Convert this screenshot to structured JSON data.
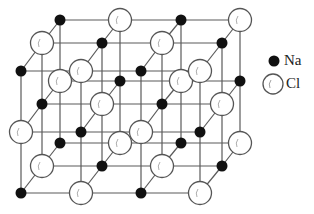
{
  "legend": {
    "items": [
      {
        "species": "Na",
        "label": "Na",
        "style": "filled",
        "color": "#111111"
      },
      {
        "species": "Cl",
        "label": "Cl",
        "style": "open",
        "color": "#ffffff"
      }
    ]
  },
  "colors": {
    "bond": "#5a5a5a",
    "na_fill": "#111111",
    "cl_fill": "#ffffff",
    "cl_stroke": "#555555"
  },
  "lattice": {
    "planes": [
      {
        "name": "back",
        "x": [
          60,
          120,
          181,
          240
        ],
        "y": [
          20,
          81,
          143
        ],
        "rows": [
          [
            "Na",
            "Cl",
            "Na",
            "Cl"
          ],
          [
            "Cl",
            "Na",
            "Cl",
            "Na"
          ],
          [
            "Na",
            "Cl",
            "Na",
            "Cl"
          ]
        ]
      },
      {
        "name": "middle",
        "x": [
          42,
          102,
          162,
          222
        ],
        "y": [
          43,
          104,
          166
        ],
        "rows": [
          [
            "Cl",
            "Na",
            "Cl",
            "Na"
          ],
          [
            "Na",
            "Cl",
            "Na",
            "Cl"
          ],
          [
            "Cl",
            "Na",
            "Cl",
            "Na"
          ]
        ]
      },
      {
        "name": "front",
        "x": [
          21,
          81,
          141,
          200
        ],
        "y": [
          71,
          132,
          193
        ],
        "rows": [
          [
            "Na",
            "Cl",
            "Na",
            "Cl"
          ],
          [
            "Cl",
            "Na",
            "Cl",
            "Na"
          ],
          [
            "Na",
            "Cl",
            "Na",
            "Cl"
          ]
        ]
      }
    ]
  }
}
